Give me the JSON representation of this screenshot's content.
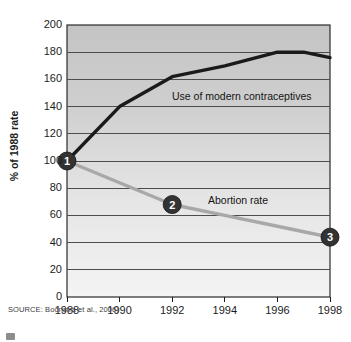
{
  "source_note": "SOURCE: Boonstra et al., 2006)",
  "axes": {
    "y_title": "% of 1988 rate",
    "y_ticks": [
      "200",
      "180",
      "160",
      "140",
      "120",
      "100",
      "80",
      "60",
      "40",
      "20",
      "0"
    ],
    "x_ticks": [
      "1988",
      "1990",
      "1992",
      "1994",
      "1996",
      "1998"
    ]
  },
  "labels": {
    "contraceptives": "Use of modern contraceptives",
    "abortion": "Abortion rate"
  },
  "markers": {
    "one": "1",
    "two": "2",
    "three": "3"
  },
  "colors": {
    "dark_line": "#1a1a1a",
    "light_line": "#a8a8a8",
    "marker_fill": "#333333",
    "marker_text": "#ffffff",
    "plot_bg_top": "#c9c9c9",
    "plot_bg_bottom": "#f2f2f2",
    "gridline": "#4d4d4d",
    "axis": "#1c1c1c"
  },
  "chart_data": {
    "type": "line",
    "title": "",
    "xlabel": "",
    "ylabel": "% of 1988 rate",
    "xlim": [
      1988,
      1998
    ],
    "ylim": [
      0,
      200
    ],
    "ytick_step": 20,
    "grid": true,
    "legend": "inline-annotations",
    "x": [
      1988,
      1990,
      1992,
      1994,
      1996,
      1997,
      1998
    ],
    "series": [
      {
        "name": "Use of modern contraceptives",
        "color": "#1a1a1a",
        "values": [
          100,
          140,
          162,
          170,
          180,
          180,
          176
        ]
      },
      {
        "name": "Abortion rate",
        "color": "#a8a8a8",
        "values": [
          100,
          84,
          68,
          60,
          52,
          48,
          44
        ]
      }
    ],
    "annotations": [
      {
        "label": "1",
        "x": 1988,
        "y": 100
      },
      {
        "label": "2",
        "x": 1992,
        "y": 68
      },
      {
        "label": "3",
        "x": 1998,
        "y": 44
      }
    ]
  }
}
